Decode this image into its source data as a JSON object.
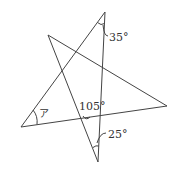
{
  "diagram": {
    "type": "star-pentagram-angles",
    "vertices": {
      "top": [
        105,
        12
      ],
      "upper_left": [
        48,
        35
      ],
      "right": [
        167,
        106
      ],
      "left": [
        21,
        127
      ],
      "bottom": [
        98,
        162
      ]
    },
    "labels": {
      "angle_top": "35°",
      "angle_center": "105°",
      "angle_bottom": "25°",
      "angle_unknown": "ア"
    },
    "line_color": "#444444"
  }
}
